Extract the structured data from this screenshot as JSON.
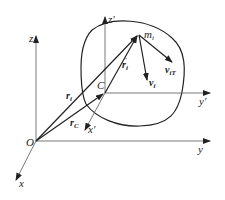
{
  "figure": {
    "labels": {
      "z": "z",
      "y": "y",
      "x": "x",
      "origin": "O",
      "z_prime": "z'",
      "y_prime": "y'",
      "x_prime": "x'",
      "center": "C",
      "mass": "m",
      "mass_sub": "i",
      "r_i": "r",
      "r_i_sub": "i",
      "r_C": "r",
      "r_C_sub": "C",
      "r_i_prime": "r",
      "r_i_prime_sub": "i",
      "r_i_prime_sup": "'",
      "v_i": "v",
      "v_i_sub": "i",
      "v_iT": "v",
      "v_iT_sub": "iT"
    },
    "colors": {
      "line": "#222222",
      "background": "#ffffff"
    }
  }
}
